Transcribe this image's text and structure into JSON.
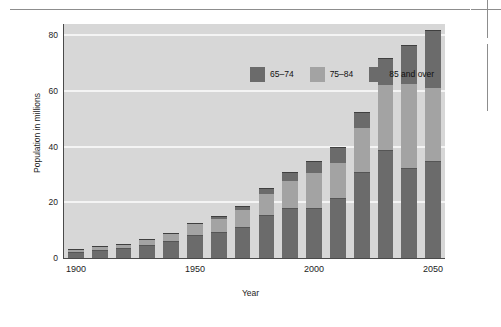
{
  "figure": {
    "page_marks": {
      "top_rule": "horizontal-rule",
      "crop_mark": "registration-crop-mark"
    }
  },
  "chart_data": {
    "type": "bar",
    "stacked": true,
    "title": "",
    "xlabel": "Year",
    "ylabel": "Population in millions",
    "categories": [
      "1900",
      "1910",
      "1920",
      "1930",
      "1940",
      "1950",
      "1960",
      "1970",
      "1980",
      "1990",
      "2000",
      "2010",
      "2020",
      "2030",
      "2040",
      "2050"
    ],
    "xtick_labels": [
      "1900",
      "1950",
      "2000",
      "2050"
    ],
    "xtick_categories": [
      "1900",
      "1950",
      "2000",
      "2050"
    ],
    "ytick_labels": [
      "0",
      "20",
      "40",
      "60",
      "80"
    ],
    "yticks": [
      0,
      20,
      40,
      60,
      80
    ],
    "ylim": [
      0,
      84
    ],
    "grid": "horizontal-white-gridlines",
    "legend_position": "inside-top-center",
    "series": [
      {
        "name": "65–74",
        "color": "#6b6b6b",
        "values": [
          2.2,
          2.8,
          3.5,
          4.5,
          6.0,
          8.3,
          9.5,
          11.2,
          15.4,
          17.8,
          18.1,
          21.4,
          31.0,
          38.8,
          32.2,
          34.7
        ]
      },
      {
        "name": "75–84",
        "color": "#a3a3a3",
        "values": [
          0.8,
          1.0,
          1.3,
          1.9,
          2.6,
          3.8,
          4.6,
          6.2,
          7.7,
          10.0,
          12.4,
          12.8,
          15.8,
          23.3,
          30.1,
          26.2
        ]
      },
      {
        "name": "85 and over",
        "color": "#6b6b6b",
        "values": [
          0.1,
          0.2,
          0.2,
          0.3,
          0.4,
          0.6,
          0.9,
          1.4,
          2.2,
          3.1,
          4.2,
          5.7,
          5.7,
          9.6,
          14.0,
          20.9
        ]
      }
    ],
    "totals": [
      3.1,
      4.0,
      5.0,
      6.7,
      9.0,
      12.7,
      15.0,
      18.8,
      25.3,
      30.9,
      34.7,
      39.9,
      52.5,
      71.7,
      76.3,
      81.8
    ]
  },
  "legend": {
    "items": [
      {
        "label": "65–74",
        "swatch": "swatch-65-74"
      },
      {
        "label": "75–84",
        "swatch": "swatch-75-84"
      },
      {
        "label": "85 and over",
        "swatch": "swatch-85-over"
      }
    ]
  },
  "colors": {
    "plot_background": "#d7d7d7",
    "gridline": "#f4f4f4",
    "axis": "#4a4a4a",
    "series_65_74": "#6b6b6b",
    "series_75_84": "#a3a3a3",
    "series_85_over": "#6b6b6b",
    "page_background": "#ffffff"
  }
}
